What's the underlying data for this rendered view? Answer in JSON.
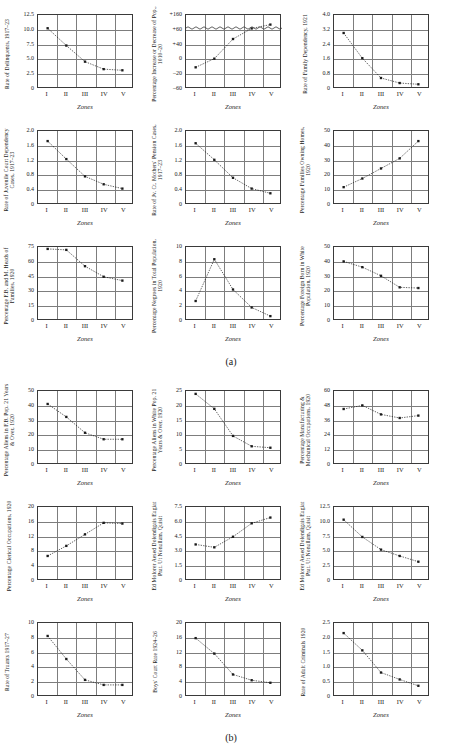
{
  "page": {
    "figures": [
      {
        "id": "a",
        "caption": "(a)"
      },
      {
        "id": "b",
        "caption": "(b)"
      }
    ],
    "zones": [
      "I",
      "II",
      "III",
      "IV",
      "V"
    ],
    "xlabel": "Zones",
    "axis_color": "#7d7d7d",
    "frame_color": "#3a3a3a",
    "marker_color": "#1a1a1a",
    "line_style": "dotted"
  },
  "chart_data": [
    {
      "figure": "a",
      "row": 0,
      "col": 0,
      "type": "scatter",
      "title": "",
      "ylabel": "Rate of Delinquents, 1917–23",
      "xlabel": "Zones",
      "categories": [
        "I",
        "II",
        "III",
        "IV",
        "V"
      ],
      "values": [
        10.2,
        7.2,
        4.4,
        3.1,
        2.9
      ],
      "yticks": [
        "0",
        "2.5",
        "5.0",
        "7.5",
        "10.0",
        "12.5"
      ],
      "ylim": [
        0,
        12.5
      ],
      "grid": true
    },
    {
      "figure": "a",
      "row": 0,
      "col": 1,
      "type": "scatter",
      "title": "",
      "ylabel": "Percentage Increase or Decrease of Pop., 1010–20",
      "xlabel": "Zones",
      "categories": [
        "I",
        "II",
        "III",
        "IV",
        "V"
      ],
      "values": [
        -19,
        -1,
        40,
        62,
        70
      ],
      "yticks": [
        "–60",
        "–20",
        "0",
        "+40",
        "+60",
        "+160"
      ],
      "ylim": [
        -60,
        160
      ],
      "broken_axis": true,
      "grid": true
    },
    {
      "figure": "a",
      "row": 0,
      "col": 2,
      "type": "scatter",
      "title": "",
      "ylabel": "Rate of Family Dependency, 1921",
      "xlabel": "Zones",
      "categories": [
        "I",
        "II",
        "III",
        "IV",
        "V"
      ],
      "values": [
        3.0,
        1.6,
        0.5,
        0.22,
        0.15
      ],
      "yticks": [
        "0",
        "0.8",
        "1.6",
        "2.4",
        "3.2",
        "4.0"
      ],
      "ylim": [
        0,
        4.0
      ],
      "grid": true
    },
    {
      "figure": "a",
      "row": 1,
      "col": 0,
      "type": "scatter",
      "title": "",
      "ylabel": "Rate of Juvenile Court Dependency Cases, 1917–23",
      "xlabel": "Zones",
      "categories": [
        "I",
        "II",
        "III",
        "IV",
        "V"
      ],
      "values": [
        1.72,
        1.22,
        0.74,
        0.52,
        0.4
      ],
      "yticks": [
        "0",
        "0.4",
        "0.8",
        "1.2",
        "1.6",
        "2.0"
      ],
      "ylim": [
        0,
        2.0
      ],
      "grid": true
    },
    {
      "figure": "a",
      "row": 1,
      "col": 1,
      "type": "scatter",
      "title": "",
      "ylabel": "Rate of Jv. Ct. Mothers' Pension Cases, 1917–23",
      "xlabel": "Zones",
      "categories": [
        "I",
        "II",
        "III",
        "IV",
        "V"
      ],
      "values": [
        1.66,
        1.2,
        0.7,
        0.4,
        0.27
      ],
      "yticks": [
        "0",
        "0.4",
        "0.8",
        "1.2",
        "1.6",
        "2.0"
      ],
      "ylim": [
        0,
        2.0
      ],
      "grid": true
    },
    {
      "figure": "a",
      "row": 1,
      "col": 2,
      "type": "scatter",
      "title": "",
      "ylabel": "Percentage Families Owning Homes, 1920",
      "xlabel": "Zones",
      "categories": [
        "I",
        "II",
        "III",
        "IV",
        "V"
      ],
      "values": [
        11,
        17,
        24,
        31,
        43
      ],
      "yticks": [
        "0",
        "10",
        "20",
        "30",
        "40",
        "50"
      ],
      "ylim": [
        0,
        50
      ],
      "grid": true
    },
    {
      "figure": "a",
      "row": 2,
      "col": 0,
      "type": "scatter",
      "title": "",
      "ylabel": "Percentage F.B. and M. Heads of Families, 1920",
      "xlabel": "Zones",
      "categories": [
        "I",
        "II",
        "III",
        "IV",
        "V"
      ],
      "values": [
        73,
        72,
        55,
        44,
        40
      ],
      "yticks": [
        "0",
        "15",
        "30",
        "45",
        "60",
        "75"
      ],
      "ylim": [
        0,
        75
      ],
      "grid": true
    },
    {
      "figure": "a",
      "row": 2,
      "col": 1,
      "type": "scatter",
      "title": "",
      "ylabel": "Percentage Negroes in Total Population, 1920",
      "xlabel": "Zones",
      "categories": [
        "I",
        "II",
        "III",
        "IV",
        "V"
      ],
      "values": [
        2.5,
        8.3,
        4.1,
        1.6,
        0.4
      ],
      "yticks": [
        "0",
        "2",
        "4",
        "6",
        "8",
        "10"
      ],
      "ylim": [
        0,
        10
      ],
      "grid": true
    },
    {
      "figure": "a",
      "row": 2,
      "col": 2,
      "type": "scatter",
      "title": "",
      "ylabel": "Percentage Foreign Born in White Population, 1920",
      "xlabel": "Zones",
      "categories": [
        "I",
        "II",
        "III",
        "IV",
        "V"
      ],
      "values": [
        40,
        36,
        30,
        22,
        21.5
      ],
      "yticks": [
        "0",
        "10",
        "20",
        "30",
        "40",
        "50"
      ],
      "ylim": [
        0,
        50
      ],
      "grid": true
    },
    {
      "figure": "b",
      "row": 0,
      "col": 0,
      "type": "scatter",
      "title": "",
      "ylabel": "Percentage Aliens in F.B. Pop. 21 Years & Over, 1920",
      "xlabel": "Zones",
      "categories": [
        "I",
        "II",
        "III",
        "IV",
        "V"
      ],
      "values": [
        41,
        32,
        21,
        16.5,
        16.5
      ],
      "yticks": [
        "0",
        "10",
        "20",
        "30",
        "40",
        "50"
      ],
      "ylim": [
        0,
        50
      ],
      "grid": true
    },
    {
      "figure": "b",
      "row": 0,
      "col": 1,
      "type": "scatter",
      "title": "",
      "ylabel": "Percentage Aliens in White Pop. 21 Years & Over, 1920",
      "xlabel": "Zones",
      "categories": [
        "I",
        "II",
        "III",
        "IV",
        "V"
      ],
      "values": [
        24,
        18.8,
        9.4,
        5.8,
        5.3
      ],
      "yticks": [
        "0",
        "5",
        "10",
        "15",
        "20",
        "25"
      ],
      "ylim": [
        0,
        25
      ],
      "grid": true
    },
    {
      "figure": "b",
      "row": 0,
      "col": 2,
      "type": "scatter",
      "title": "",
      "ylabel": "Percentage Manufacturing & Mechanical Occupations, 1920",
      "xlabel": "Zones",
      "categories": [
        "I",
        "II",
        "III",
        "IV",
        "V"
      ],
      "values": [
        45,
        48,
        40.5,
        37.5,
        39.5
      ],
      "yticks": [
        "0",
        "12",
        "24",
        "36",
        "48",
        "60"
      ],
      "ylim": [
        0,
        60
      ],
      "grid": true
    },
    {
      "figure": "b",
      "row": 1,
      "col": 0,
      "type": "scatter",
      "title": "",
      "ylabel": "Percentage Clerical Occupations, 1920",
      "xlabel": "Zones",
      "categories": [
        "I",
        "II",
        "III",
        "IV",
        "V"
      ],
      "values": [
        6.4,
        9.2,
        12.4,
        15.6,
        15.4
      ],
      "yticks": [
        "0",
        "4",
        "8",
        "12",
        "16",
        "20"
      ],
      "ylim": [
        0,
        20
      ],
      "grid": true
    },
    {
      "figure": "b",
      "row": 1,
      "col": 1,
      "type": "scatter",
      "title": "",
      "ylabel": "Ed Molorer Aesed Dolendigais Eugiat Prat. Ut Nonullam, Quisit",
      "xlabel": "Zones",
      "categories": [
        "I",
        "II",
        "III",
        "IV",
        "V"
      ],
      "values": [
        3.6,
        3.3,
        4.4,
        5.8,
        6.4
      ],
      "yticks": [
        "0",
        "1.5",
        "3.0",
        "4.5",
        "6.0",
        "7.5"
      ],
      "ylim": [
        0,
        7.5
      ],
      "grid": true
    },
    {
      "figure": "b",
      "row": 1,
      "col": 2,
      "type": "scatter",
      "title": "",
      "ylabel": "Ed Molorer Aesed Dolendigais Eugiat Prat. Ut Nonullam, Quisit",
      "xlabel": "Zones",
      "categories": [
        "I",
        "II",
        "III",
        "IV",
        "V"
      ],
      "values": [
        10.3,
        7.3,
        5.1,
        4.0,
        3.0
      ],
      "yticks": [
        "0",
        "2.5",
        "5.0",
        "7.5",
        "10.0",
        "12.5"
      ],
      "ylim": [
        0,
        12.5
      ],
      "grid": true
    },
    {
      "figure": "b",
      "row": 2,
      "col": 0,
      "type": "scatter",
      "title": "",
      "ylabel": "Rate of Truants 1917–27",
      "xlabel": "Zones",
      "categories": [
        "I",
        "II",
        "III",
        "IV",
        "V"
      ],
      "values": [
        8.2,
        5.0,
        2.1,
        1.4,
        1.4
      ],
      "yticks": [
        "0",
        "2",
        "4",
        "6",
        "8",
        "10"
      ],
      "ylim": [
        0,
        10
      ],
      "grid": true
    },
    {
      "figure": "b",
      "row": 2,
      "col": 1,
      "type": "scatter",
      "title": "",
      "ylabel": "Boys' Court Rate 1924–26",
      "xlabel": "Zones",
      "categories": [
        "I",
        "II",
        "III",
        "IV",
        "V"
      ],
      "values": [
        15.8,
        11.5,
        5.7,
        4.1,
        3.4
      ],
      "yticks": [
        "0",
        "4",
        "8",
        "12",
        "16",
        "20"
      ],
      "ylim": [
        0,
        20
      ],
      "grid": true
    },
    {
      "figure": "b",
      "row": 2,
      "col": 2,
      "type": "scatter",
      "title": "",
      "ylabel": "Rate of Adult Criminals 1920",
      "xlabel": "Zones",
      "categories": [
        "I",
        "II",
        "III",
        "IV",
        "V"
      ],
      "values": [
        2.15,
        1.55,
        0.78,
        0.54,
        0.32
      ],
      "yticks": [
        "0",
        "0.5",
        "1.0",
        "1.5",
        "2.0",
        "2.5"
      ],
      "ylim": [
        0,
        2.5
      ],
      "grid": true
    }
  ]
}
